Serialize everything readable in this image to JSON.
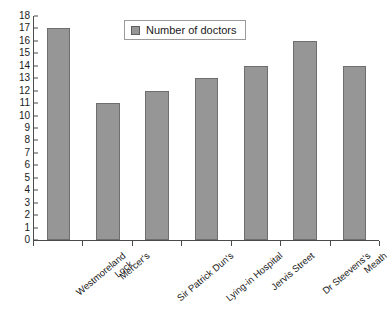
{
  "chart_data": {
    "type": "bar",
    "title": "",
    "xlabel": "",
    "ylabel": "",
    "ylim": [
      0,
      18
    ],
    "ytick_step": 1,
    "grid": false,
    "legend_position": "top-center",
    "series_name": "Number of doctors",
    "categories": [
      "Westmoreland Lock",
      "Mercer's",
      "Sir Patrick Dun's",
      "Lying-in Hospital",
      "Jervis Street",
      "Dr Steevens's",
      "Meath"
    ],
    "category_lines": [
      [
        "Westmoreland",
        "Lock"
      ],
      [
        "Mercer's",
        ""
      ],
      [
        "Sir Patrick Dun's",
        ""
      ],
      [
        "Lying-in Hospital",
        ""
      ],
      [
        "Jervis Street",
        ""
      ],
      [
        "Dr Steevens's",
        ""
      ],
      [
        "Meath",
        ""
      ]
    ],
    "values": [
      17,
      11,
      12,
      13,
      14,
      16,
      14
    ],
    "yticks": [
      18,
      17,
      16,
      15,
      14,
      13,
      12,
      11,
      10,
      9,
      8,
      7,
      6,
      5,
      4,
      3,
      2,
      1,
      0
    ]
  },
  "legend": {
    "label": "Number of doctors"
  },
  "colors": {
    "bar_fill": "#969696",
    "bar_border": "#6e6e6e",
    "axis": "#4a4a4a",
    "text": "#1a1a1a",
    "legend_border": "#9a9a9a",
    "background": "#ffffff"
  }
}
